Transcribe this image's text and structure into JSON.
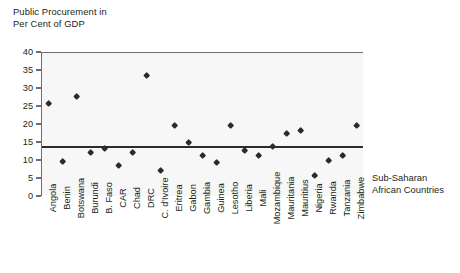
{
  "chart_data": {
    "type": "scatter",
    "title": "Public Procurement in\nPer Cent of GDP",
    "xlabel": "Sub-Saharan\nAfrican Countries",
    "ylabel": "",
    "ylim": [
      0,
      40
    ],
    "yticks": [
      0,
      5,
      10,
      15,
      20,
      25,
      30,
      35,
      40
    ],
    "grid": false,
    "legend": false,
    "categories": [
      "Angola",
      "Benin",
      "Botswana",
      "Burundi",
      "B. Faso",
      "CAR",
      "Chad",
      "DRC",
      "C. d'Ivoire",
      "Eritrea",
      "Gabon",
      "Gambia",
      "Guinea",
      "Lesotho",
      "Liberia",
      "Mali",
      "Mozambique",
      "Mauritania",
      "Mauritius",
      "Nigeria",
      "Rwanda",
      "Tanzania",
      "Zimbabwe"
    ],
    "values": [
      25.8,
      9.9,
      27.9,
      12.4,
      13.3,
      8.8,
      12.3,
      33.6,
      7.3,
      19.7,
      15.2,
      11.4,
      9.5,
      19.8,
      12.8,
      11.6,
      14.0,
      17.6,
      18.3,
      5.9,
      10.1,
      11.6,
      19.9
    ],
    "reference_line": {
      "value": 14.0,
      "label": ""
    },
    "marker": "diamond",
    "marker_color": "#2b2b2b",
    "line_color": "#2b2b2b",
    "plot_background": "#f7f7f7",
    "axis_color": "#6e6e6e"
  }
}
